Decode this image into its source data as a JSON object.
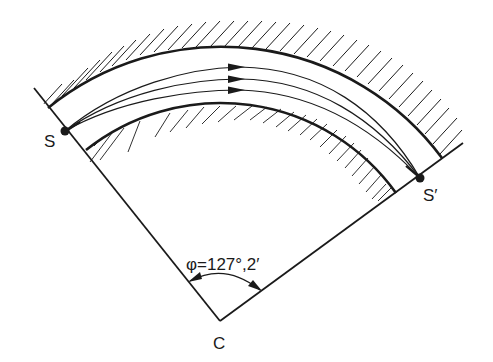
{
  "diagram": {
    "type": "magnetic-sector-focusing",
    "labels": {
      "source": "S",
      "image": "S′",
      "center": "C",
      "angle": "φ=127°,2′"
    },
    "colors": {
      "ink": "#1a1a1a",
      "background": "#ffffff"
    },
    "trajectories": [
      {
        "name": "outer-ray"
      },
      {
        "name": "central-ray"
      },
      {
        "name": "inner-ray"
      }
    ]
  }
}
